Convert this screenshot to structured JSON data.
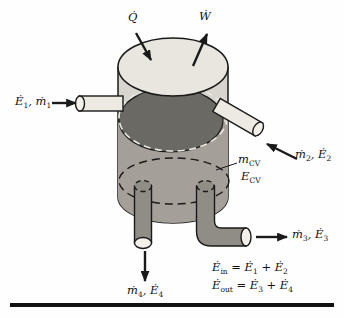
{
  "figure": {
    "colors": {
      "background": "#fefefe",
      "outline": "#1a1a1a",
      "tank_top": "#e8e6df",
      "tank_wall": "#d7d5ce",
      "tank_body": "#a49f98",
      "liquid_surface": "#6b6963",
      "pipe_light": "#eceae3",
      "pipe_dark": "#908d86",
      "pipe_opening": "#f2f0e9",
      "dash_light": "#e9e7e0",
      "text": "#111111"
    },
    "labels": {
      "heat": [
        {
          "t": "Q̇"
        }
      ],
      "work": [
        {
          "t": "Ẇ"
        }
      ],
      "inlet1": [
        {
          "t": "Ė"
        },
        {
          "s": "1"
        },
        {
          "t": ", ṁ"
        },
        {
          "s": "1"
        }
      ],
      "inlet2": [
        {
          "t": "ṁ"
        },
        {
          "s": "2"
        },
        {
          "t": ", Ė"
        },
        {
          "s": "2"
        }
      ],
      "outlet3": [
        {
          "t": "ṁ"
        },
        {
          "s": "3"
        },
        {
          "t": ", Ė"
        },
        {
          "s": "3"
        }
      ],
      "outlet4": [
        {
          "t": "ṁ"
        },
        {
          "s": "4"
        },
        {
          "t": ", Ė"
        },
        {
          "s": "4"
        }
      ],
      "mass_cv": [
        {
          "t": "m"
        },
        {
          "s": "CV"
        }
      ],
      "energy_cv": [
        {
          "t": "E"
        },
        {
          "s": "CV"
        }
      ],
      "eq_in": [
        {
          "t": "Ė"
        },
        {
          "s": "in"
        },
        {
          "t": " = Ė"
        },
        {
          "s": "1"
        },
        {
          "t": " + Ė"
        },
        {
          "s": "2"
        }
      ],
      "eq_out": [
        {
          "t": "Ė"
        },
        {
          "s": "out"
        },
        {
          "t": " = Ė"
        },
        {
          "s": "3"
        },
        {
          "t": " + Ė"
        },
        {
          "s": "4"
        }
      ]
    }
  }
}
